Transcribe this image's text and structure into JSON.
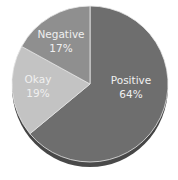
{
  "chart_data": {
    "type": "pie",
    "title": "",
    "categories": [
      "Positive",
      "Okay",
      "Negative"
    ],
    "values": [
      64,
      19,
      17
    ],
    "labels": [
      "64%",
      "19%",
      "17%"
    ],
    "colors": [
      "#6e6e6e",
      "#c3c3c3",
      "#8f8f8f"
    ],
    "start_angle": "12 o'clock, clockwise",
    "legend": "none (labels inside slices)",
    "style": "3D pie with bottom shadow"
  },
  "slices": [
    {
      "name": "Positive",
      "pct": "64%"
    },
    {
      "name": "Okay",
      "pct": "19%"
    },
    {
      "name": "Negative",
      "pct": "17%"
    }
  ]
}
